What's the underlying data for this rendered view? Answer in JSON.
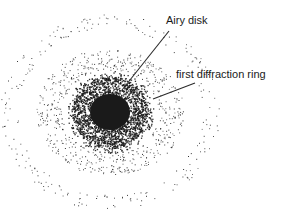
{
  "diagram": {
    "labels": {
      "airy_disk": "Airy disk",
      "first_ring": "first diffraction ring"
    },
    "colors": {
      "background": "#ffffff",
      "dots": "#1a1a1a",
      "leader_lines": "#2a2a2a",
      "text": "#1a1a1a"
    },
    "center": {
      "x": 110,
      "y": 112
    },
    "regions": [
      {
        "name": "airy-disk",
        "r_inner": 0,
        "r_outer": 36,
        "count": 2600,
        "falloff": 1.6,
        "x_scale": 1.05
      },
      {
        "name": "first-diffraction-ring",
        "r_inner": 42,
        "r_outer": 64,
        "count": 620,
        "falloff": 0,
        "x_scale": 1.15
      },
      {
        "name": "second-diffraction-ring",
        "r_inner": 82,
        "r_outer": 98,
        "count": 240,
        "falloff": 0,
        "x_scale": 1.12
      }
    ],
    "leader_lines": [
      {
        "name": "airy-disk-leader",
        "x1": 169,
        "y1": 31,
        "x2": 122,
        "y2": 90
      },
      {
        "name": "first-ring-leader",
        "x1": 195,
        "y1": 83,
        "x2": 153,
        "y2": 99
      }
    ]
  }
}
